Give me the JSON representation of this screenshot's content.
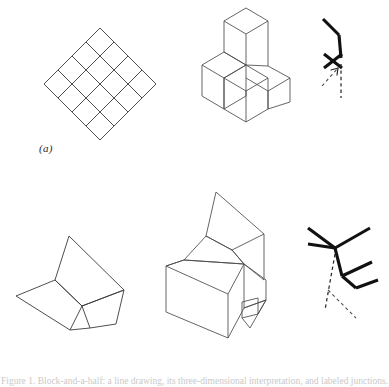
{
  "figure": {
    "caption_number": "Figure 1.",
    "caption_text": "Block-and-a-half: a line drawing, its three-dimensional interpretation, and labeled junctions.",
    "rows": [
      {
        "id": "a",
        "label": "(a)",
        "panels": [
          {
            "name": "flat-diamond-grid",
            "kind": "line-drawing",
            "description": "4 by 4 rotated square grid",
            "cells": 16,
            "rows": 4,
            "cols": 4
          },
          {
            "name": "stepped-block-tower",
            "kind": "isometric-solid",
            "description": "stepped tower of cubes"
          },
          {
            "name": "junction-label-arrow",
            "kind": "junction-diagram",
            "description": "bold arrow junction with X crossing and dashed pointer"
          }
        ]
      },
      {
        "id": "b",
        "label": "(b)",
        "panels": [
          {
            "name": "flat-polygon-fold",
            "kind": "line-drawing",
            "description": "folded quadrilateral arrangement"
          },
          {
            "name": "block-with-flap",
            "kind": "isometric-solid",
            "description": "rectangular block with tilted top flap and side tab"
          },
          {
            "name": "junction-label-double-y",
            "kind": "junction-diagram",
            "description": "two Y junctions joined by a vertical edge with dashed lines"
          }
        ]
      }
    ]
  },
  "colors": {
    "line": "#3a3a3a",
    "bold_line": "#111111",
    "dashed_line": "#2a2a2a",
    "background": "#ffffff",
    "label_text": "#2b2b2b"
  }
}
